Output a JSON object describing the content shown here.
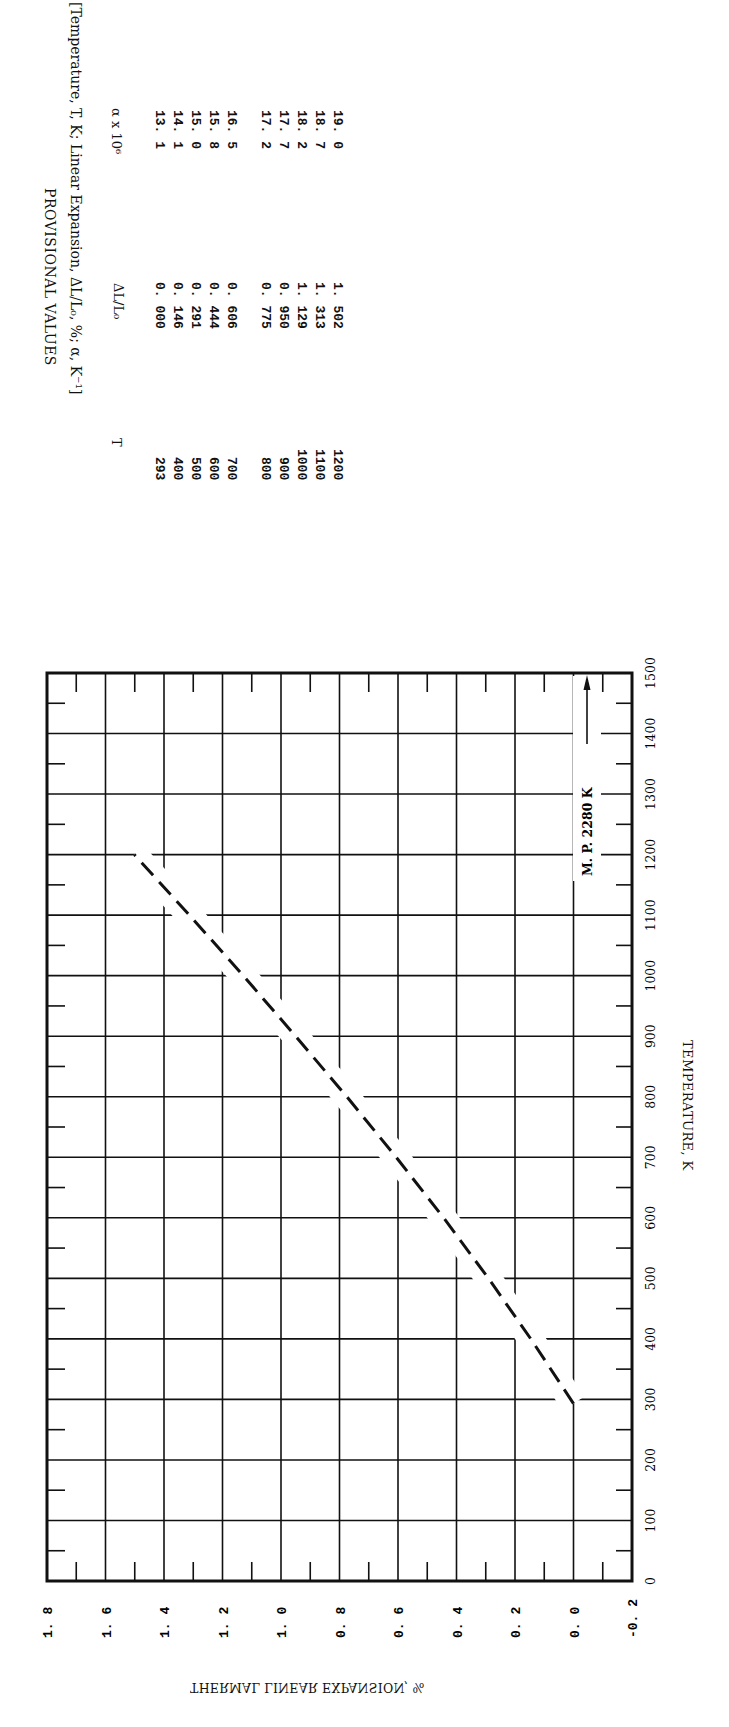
{
  "table": {
    "title": "PROVISIONAL VALUES",
    "subtitle": "[Temperature, T, K; Linear Expansion, ΔL/L₀, %; α, K⁻¹]",
    "columns": [
      "T",
      "ΔL/L₀",
      "α x 10⁶"
    ],
    "rows": [
      {
        "T": "293",
        "dL": "0. 000",
        "alpha": "13. 1"
      },
      {
        "T": "400",
        "dL": "0. 146",
        "alpha": "14. 1"
      },
      {
        "T": "500",
        "dL": "0. 291",
        "alpha": "15. 0"
      },
      {
        "T": "600",
        "dL": "0. 444",
        "alpha": "15. 8"
      },
      {
        "T": "700",
        "dL": "0. 606",
        "alpha": "16. 5"
      },
      {
        "T": "800",
        "dL": "0. 775",
        "alpha": "17. 2"
      },
      {
        "T": "900",
        "dL": "0. 950",
        "alpha": "17. 7"
      },
      {
        "T": "1000",
        "dL": "1. 129",
        "alpha": "18. 2"
      },
      {
        "T": "1100",
        "dL": "1. 313",
        "alpha": "18. 7"
      },
      {
        "T": "1200",
        "dL": "1. 502",
        "alpha": "19. 0"
      }
    ]
  },
  "chart_data": {
    "type": "line",
    "orientation": "page rotated 90 degrees",
    "title": "",
    "xlabel": "TEMPERATURE, K",
    "ylabel": "THERMAL LINEAR EXPANSION, %",
    "xlim": [
      0,
      1500
    ],
    "ylim": [
      -0.2,
      1.8
    ],
    "x_ticks": [
      "0",
      "100",
      "200",
      "300",
      "400",
      "500",
      "600",
      "700",
      "800",
      "900",
      "1000",
      "1100",
      "1200",
      "1300",
      "1400",
      "1500"
    ],
    "y_ticks": [
      "-0.2",
      "0.0",
      "0.2",
      "0.4",
      "0.6",
      "0.8",
      "1.0",
      "1.2",
      "1.4",
      "1.6",
      "1.8"
    ],
    "grid": true,
    "legend": null,
    "series": [
      {
        "name": "Provisional values",
        "style": "dashed",
        "x": [
          293,
          400,
          500,
          600,
          700,
          800,
          900,
          1000,
          1100,
          1200
        ],
        "values": [
          0.0,
          0.146,
          0.291,
          0.444,
          0.606,
          0.775,
          0.95,
          1.129,
          1.313,
          1.502
        ]
      }
    ],
    "annotations": [
      {
        "text": "M.P. 2280 K",
        "arrow": "points toward higher temperature (off-scale)"
      }
    ]
  },
  "labels": {
    "y_tick_labels": [
      "1. 8",
      "1. 6",
      "1. 4",
      "1. 2",
      "1. 0",
      "0. 8",
      "0. 6",
      "0. 4",
      "0. 2",
      "0. 0",
      "-0. 2"
    ],
    "mp_annotation": "M. P.  2280 K",
    "x_axis_title": "TEMPERATURE, K",
    "y_axis_title": "THERMAL LINEAR EXPANSION, %"
  }
}
